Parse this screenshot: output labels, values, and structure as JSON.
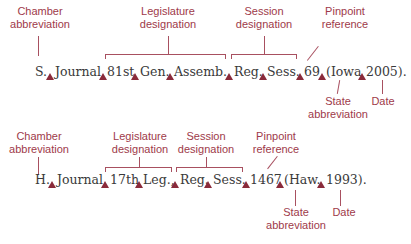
{
  "colors": {
    "label": "#9e3a4a",
    "marker": "#8a2a3a",
    "text": "#3a3a3a",
    "line": "#a85060"
  },
  "rows": [
    {
      "tokens": [
        "S.",
        "Journal,",
        "81st",
        "Gen.",
        "Assemb.,",
        "Reg.",
        "Sess.",
        "69",
        "(Iowa",
        "2005)."
      ],
      "labels": {
        "chamber": [
          "Chamber",
          "abbreviation"
        ],
        "legislature": [
          "Legislature",
          "designation"
        ],
        "session": [
          "Session",
          "designation"
        ],
        "pinpoint": [
          "Pinpoint",
          "reference"
        ],
        "state": [
          "State",
          "abbreviation"
        ],
        "date": [
          "Date"
        ]
      }
    },
    {
      "tokens": [
        "H.",
        "Journal,",
        "17th",
        "Leg.,",
        "Reg.",
        "Sess.",
        "1467",
        "(Haw.",
        "1993)."
      ],
      "labels": {
        "chamber": [
          "Chamber",
          "abbreviation"
        ],
        "legislature": [
          "Legislature",
          "designation"
        ],
        "session": [
          "Session",
          "designation"
        ],
        "pinpoint": [
          "Pinpoint",
          "reference"
        ],
        "state": [
          "State",
          "abbreviation"
        ],
        "date": [
          "Date"
        ]
      }
    }
  ],
  "marker_icon": "space-triangle-icon"
}
